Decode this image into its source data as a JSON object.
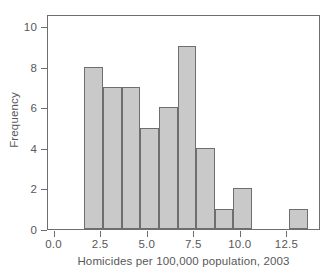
{
  "chart_data": {
    "type": "bar",
    "title": "",
    "subtitle": "",
    "xlabel": "Homicides per 100,000 population, 2003",
    "ylabel": "Frequency",
    "xlim": [
      -0.35,
      14.3
    ],
    "ylim": [
      0,
      10.6
    ],
    "xticks": [
      "0.0",
      "2.5",
      "5.0",
      "7.5",
      "10.0",
      "12.5"
    ],
    "xtick_values": [
      0.0,
      2.5,
      5.0,
      7.5,
      10.0,
      12.5
    ],
    "yticks": [
      "0",
      "2",
      "4",
      "6",
      "8",
      "10"
    ],
    "ytick_values": [
      0,
      2,
      4,
      6,
      8,
      10
    ],
    "grid": false,
    "legend": null,
    "bin_width": 1.0,
    "bins": [
      {
        "label": "1.6-2.6",
        "x_left": 1.6,
        "x_right": 2.6,
        "value": 8
      },
      {
        "label": "2.6-3.6",
        "x_left": 2.6,
        "x_right": 3.6,
        "value": 7
      },
      {
        "label": "3.6-4.6",
        "x_left": 3.6,
        "x_right": 4.6,
        "value": 7
      },
      {
        "label": "4.6-5.6",
        "x_left": 4.6,
        "x_right": 5.6,
        "value": 5
      },
      {
        "label": "5.6-6.6",
        "x_left": 5.6,
        "x_right": 6.6,
        "value": 6
      },
      {
        "label": "6.6-7.6",
        "x_left": 6.6,
        "x_right": 7.6,
        "value": 9
      },
      {
        "label": "7.6-8.6",
        "x_left": 7.6,
        "x_right": 8.6,
        "value": 4
      },
      {
        "label": "8.6-9.6",
        "x_left": 8.6,
        "x_right": 9.6,
        "value": 1
      },
      {
        "label": "9.6-10.6",
        "x_left": 9.6,
        "x_right": 10.6,
        "value": 2
      },
      {
        "label": "12.6-13.6",
        "x_left": 12.6,
        "x_right": 13.6,
        "value": 1
      }
    ],
    "categories": [
      "1.6-2.6",
      "2.6-3.6",
      "3.6-4.6",
      "4.6-5.6",
      "5.6-6.6",
      "6.6-7.6",
      "7.6-8.6",
      "8.6-9.6",
      "9.6-10.6",
      "12.6-13.6"
    ],
    "values": [
      8,
      7,
      7,
      5,
      6,
      9,
      4,
      1,
      2,
      1
    ],
    "colors": {
      "bar_fill": "#c9c9c9",
      "bar_edge": "#6d6e70",
      "axis": "#6d6e70",
      "text": "#58585a",
      "background": "#ffffff"
    }
  }
}
